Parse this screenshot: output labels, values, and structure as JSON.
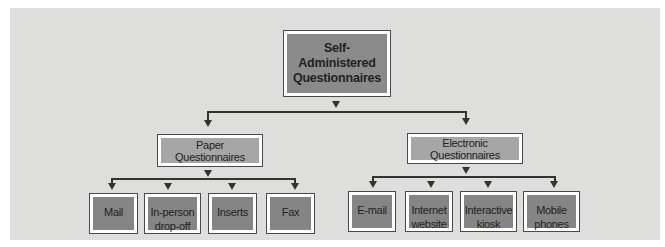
{
  "diagram": {
    "type": "hierarchy-tree",
    "root": {
      "label_line1": "Self-Administered",
      "label_line2": "Questionnaires"
    },
    "branches": [
      {
        "label": "Paper Questionnaires",
        "children": [
          {
            "line1": "Mail",
            "line2": ""
          },
          {
            "line1": "In-person",
            "line2": "drop-off"
          },
          {
            "line1": "Inserts",
            "line2": ""
          },
          {
            "line1": "Fax",
            "line2": ""
          }
        ]
      },
      {
        "label": "Electronic Questionnaires",
        "children": [
          {
            "line1": "E-mail",
            "line2": ""
          },
          {
            "line1": "Internet",
            "line2": "website"
          },
          {
            "line1": "Interactive",
            "line2": "kiosk"
          },
          {
            "line1": "Mobile",
            "line2": "phones"
          }
        ]
      }
    ],
    "colors": {
      "panel_background": "#dededd",
      "root_fill": "#8a8a8a",
      "branch_fill": "#a6a6a6",
      "leaf_fill": "#858585",
      "connector": "#333333"
    }
  }
}
